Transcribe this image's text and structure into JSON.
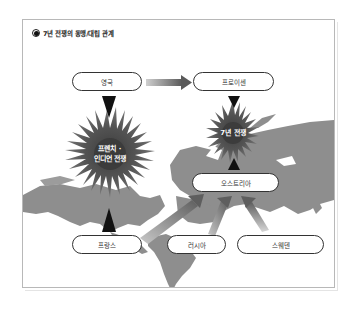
{
  "title": "7년 전쟁의 동맹/대립 관계",
  "colors": {
    "frame_border": "#b8b8b8",
    "land": "#8e8e8e",
    "burst_dark": "#3a3a3a",
    "arrow_gray": "#6e6e6e",
    "text": "#333333"
  },
  "nodes": {
    "britain": "영국",
    "prussia": "프로이센",
    "austria": "오스트리아",
    "france": "프랑스",
    "russia": "러시아",
    "sweden": "스웨덴"
  },
  "conflicts": {
    "french_indian_war_line1": "프렌치 ·",
    "french_indian_war_line2": "인디언 전쟁",
    "seven_years_war": "7년 전쟁"
  },
  "relations": [
    {
      "from": "영국",
      "to": "프로이센",
      "type": "alliance"
    },
    {
      "from": "영국",
      "to": "프랑스",
      "type": "conflict",
      "war": "프렌치 · 인디언 전쟁"
    },
    {
      "from": "프로이센",
      "to": "오스트리아",
      "type": "conflict",
      "war": "7년 전쟁"
    },
    {
      "from": "프랑스",
      "to": "오스트리아",
      "type": "alliance"
    },
    {
      "from": "러시아",
      "to": "오스트리아",
      "type": "alliance"
    },
    {
      "from": "스웨덴",
      "to": "오스트리아",
      "type": "alliance"
    }
  ]
}
